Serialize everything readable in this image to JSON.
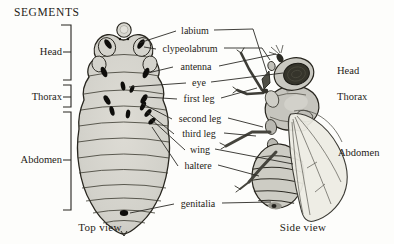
{
  "title": "SEGMENTS",
  "larva": {
    "caption": "Top view",
    "regions": [
      {
        "label": "Head"
      },
      {
        "label": "Thorax"
      },
      {
        "label": "Abdomen"
      }
    ]
  },
  "fly": {
    "caption": "Side view",
    "regions": [
      {
        "label": "Head"
      },
      {
        "label": "Thorax"
      },
      {
        "label": "Abdomen"
      }
    ]
  },
  "structures": [
    {
      "label": "labium"
    },
    {
      "label": "clypeolabrum"
    },
    {
      "label": "antenna"
    },
    {
      "label": "eye"
    },
    {
      "label": "first leg"
    },
    {
      "label": "second leg"
    },
    {
      "label": "third leg"
    },
    {
      "label": "wing"
    },
    {
      "label": "haltere"
    },
    {
      "label": "genitalia"
    }
  ],
  "colors": {
    "background": "#fdfdfb",
    "ink": "#1f1c17",
    "body_fill": "#d5d4cd",
    "disc_fill": "#0e0d0b",
    "wing_fill": "#edece3",
    "eye_fill": "#35342b"
  }
}
